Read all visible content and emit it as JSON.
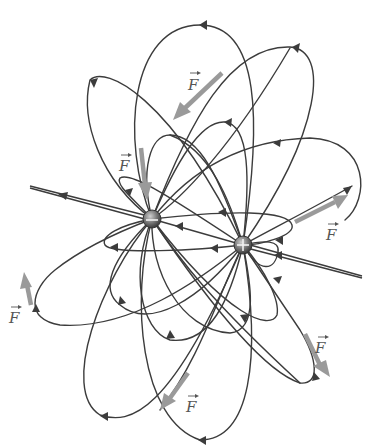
{
  "figure": {
    "colors": {
      "background": "#ffffff",
      "field_line": "#3c3c3c",
      "force_vector": "#9a9a9a",
      "label": "#555555",
      "charge_fill_dark": "#4a4a4a",
      "charge_fill_light": "#b8b8b8"
    }
  },
  "charges": [
    {
      "id": "negative",
      "sign": "−",
      "x": 152,
      "y": 219,
      "radius": 9
    },
    {
      "id": "positive",
      "sign": "+",
      "x": 243,
      "y": 245,
      "radius": 9
    }
  ],
  "force_labels": [
    {
      "id": "force-top",
      "text": "F",
      "x": 190,
      "y": 84
    },
    {
      "id": "force-upper-left",
      "text": "F",
      "x": 121,
      "y": 168
    },
    {
      "id": "force-right",
      "text": "F",
      "x": 328,
      "y": 236
    },
    {
      "id": "force-left",
      "text": "F",
      "x": 11,
      "y": 318
    },
    {
      "id": "force-lower-right",
      "text": "F",
      "x": 317,
      "y": 347
    },
    {
      "id": "force-bottom",
      "text": "F",
      "x": 187,
      "y": 407
    }
  ]
}
